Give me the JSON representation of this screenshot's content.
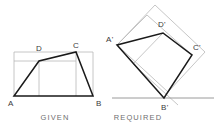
{
  "figure": {
    "type": "technical-drawing",
    "background_color": "#ffffff",
    "shape_line_color": "#1a1a1a",
    "construction_line_color": "#b8b8b8",
    "ground_line_color": "#9a9a9a",
    "label_color": "#3b3b3b",
    "caption_color": "#6f6f6f"
  },
  "given": {
    "caption": "GIVEN",
    "caption_pos": {
      "x": 55,
      "y": 120
    },
    "vertices": [
      {
        "label": "A",
        "x": 14,
        "y": 96,
        "label_x": 8,
        "label_y": 106
      },
      {
        "label": "B",
        "x": 93,
        "y": 96,
        "label_x": 96,
        "label_y": 106
      },
      {
        "label": "C",
        "x": 76,
        "y": 52,
        "label_x": 73,
        "label_y": 48
      },
      {
        "label": "D",
        "x": 39,
        "y": 61,
        "label_x": 36,
        "label_y": 51
      }
    ],
    "shape_path": "M 14 96 L 93 96 L 76 52 L 39 61 Z",
    "construction_paths": [
      "M 14 52 L 93 52",
      "M 14 61 L 76 61",
      "M 14 52 L 14 96",
      "M 39 61 L 39 96",
      "M 76 52 L 76 96",
      "M 93 52 L 93 96"
    ],
    "baseline": "M 14 96 L 93 96"
  },
  "required": {
    "caption": "REQUIRED",
    "caption_pos": {
      "x": 138,
      "y": 120
    },
    "vertices": [
      {
        "label": "A'",
        "x": 117,
        "y": 45,
        "label_x": 106,
        "label_y": 42
      },
      {
        "label": "B'",
        "x": 164,
        "y": 98,
        "label_x": 161,
        "label_y": 110
      },
      {
        "label": "C'",
        "x": 192,
        "y": 55,
        "label_x": 193,
        "label_y": 50
      },
      {
        "label": "D'",
        "x": 163,
        "y": 33,
        "label_x": 158,
        "label_y": 27
      }
    ],
    "shape_path": "M 117 45 L 164 98 L 192 55 L 163 33 Z",
    "construction_paths": [
      "M 117 45 L 155 5",
      "M 155 5 L 205 52",
      "M 205 52 L 168 92",
      "M 168 92 L 117 45",
      "M 163 33 L 133 64",
      "M 133 64 L 178 105",
      "M 192 55 L 147 15",
      "M 147 15 L 117 45"
    ],
    "ground_line": "M 112 98 L 214 98"
  }
}
